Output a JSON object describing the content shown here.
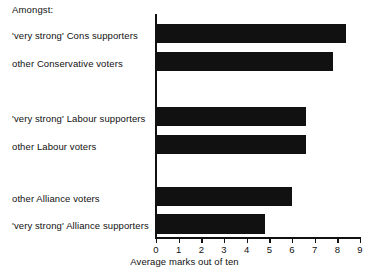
{
  "header": {
    "amongst_label": "Amongst:"
  },
  "axis_title": "Average marks out of ten",
  "ticks": [
    "0",
    "1",
    "2",
    "3",
    "4",
    "5",
    "6",
    "7",
    "8",
    "9"
  ],
  "colors": {
    "bar": "#111111",
    "axis": "#111111",
    "background": "#ffffff"
  },
  "chart_data": {
    "type": "bar",
    "orientation": "horizontal",
    "title": "",
    "subtitle": "Amongst:",
    "xlabel": "Average marks out of ten",
    "ylabel": "",
    "xlim": [
      0,
      9
    ],
    "xticks": [
      0,
      1,
      2,
      3,
      4,
      5,
      6,
      7,
      8,
      9
    ],
    "grid": false,
    "legend": "none",
    "categories": [
      "'very strong' Cons supporters",
      "other Conservative voters",
      "'very strong' Labour supporters",
      "other Labour voters",
      "other Alliance voters",
      "'very strong' Alliance supporters"
    ],
    "values": [
      8.4,
      7.8,
      6.6,
      6.6,
      6.0,
      4.8
    ],
    "groups": [
      {
        "name": "Conservative",
        "categories": [
          "'very strong' Cons supporters",
          "other Conservative voters"
        ],
        "values": [
          8.4,
          7.8
        ]
      },
      {
        "name": "Labour",
        "categories": [
          "'very strong' Labour supporters",
          "other Labour voters"
        ],
        "values": [
          6.6,
          6.6
        ]
      },
      {
        "name": "Alliance",
        "categories": [
          "other Alliance voters",
          "'very strong' Alliance supporters"
        ],
        "values": [
          6.0,
          4.8
        ]
      }
    ]
  }
}
